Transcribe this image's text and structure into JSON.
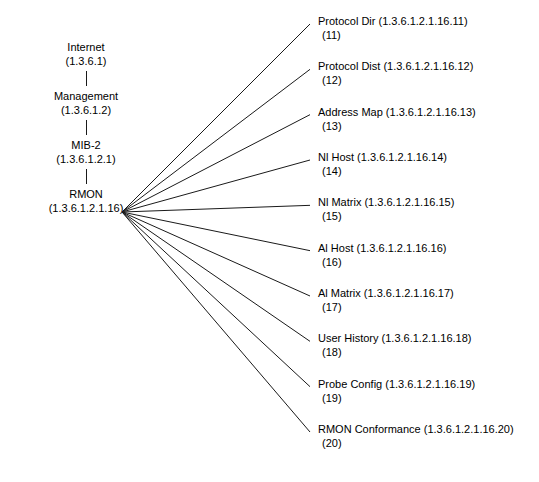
{
  "diagram": {
    "line_color": "#1a1a1a",
    "background": "#ffffff",
    "chain": [
      {
        "name": "Internet",
        "oid": "(1.3.6.1)"
      },
      {
        "name": "Management",
        "oid": "(1.3.6.1.2)"
      },
      {
        "name": "MIB-2",
        "oid": "(1.3.6.1.2.1)"
      },
      {
        "name": "RMON",
        "oid": "(1.3.6.1.2.1.16)"
      }
    ],
    "leaves": [
      {
        "title": "Protocol Dir (1.3.6.1.2.1.16.11)",
        "index": "(11)"
      },
      {
        "title": "Protocol Dist (1.3.6.1.2.1.16.12)",
        "index": "(12)"
      },
      {
        "title": "Address Map (1.3.6.1.2.1.16.13)",
        "index": "(13)"
      },
      {
        "title": "Nl Host (1.3.6.1.2.1.16.14)",
        "index": "(14)"
      },
      {
        "title": "Nl Matrix (1.3.6.1.2.1.16.15)",
        "index": "(15)"
      },
      {
        "title": "Al Host (1.3.6.1.2.1.16.16)",
        "index": "(16)"
      },
      {
        "title": "Al Matrix (1.3.6.1.2.1.16.17)",
        "index": "(17)"
      },
      {
        "title": "User History (1.3.6.1.2.1.16.18)",
        "index": "(18)"
      },
      {
        "title": "Probe  Config  (1.3.6.1.2.1.16.19)",
        "index": "(19)"
      },
      {
        "title": "RMON Conformance (1.3.6.1.2.1.16.20)",
        "index": "(20)"
      }
    ]
  }
}
